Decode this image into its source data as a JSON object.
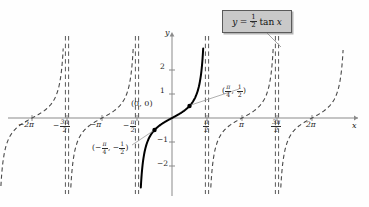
{
  "chart_data": {
    "type": "line",
    "equation_label": "y = ½ tan x",
    "xlabel": "x",
    "ylabel": "y",
    "xlim": [
      -7.2,
      7.4
    ],
    "ylim": [
      -2.9,
      2.9
    ],
    "grid": false,
    "legend": "none",
    "function": "y = 0.5 * tan(x)",
    "amplitude_factor": 0.5,
    "period": 3.14159,
    "x_ticks": [
      {
        "value": -6.2832,
        "label": "-2π",
        "num": "",
        "den": ""
      },
      {
        "value": -4.7124,
        "label": "-3π/2",
        "num": "3π",
        "den": "2"
      },
      {
        "value": -3.1416,
        "label": "-π",
        "num": "",
        "den": ""
      },
      {
        "value": -1.5708,
        "label": "-π/2",
        "num": "π",
        "den": "2"
      },
      {
        "value": 1.5708,
        "label": "π/2",
        "num": "π",
        "den": "2"
      },
      {
        "value": 3.1416,
        "label": "π",
        "num": "",
        "den": ""
      },
      {
        "value": 4.7124,
        "label": "3π/2",
        "num": "3π",
        "den": "2"
      },
      {
        "value": 6.2832,
        "label": "2π",
        "num": "",
        "den": ""
      }
    ],
    "y_ticks": [
      {
        "value": 2,
        "label": "2"
      },
      {
        "value": 1,
        "label": "1"
      },
      {
        "value": -1,
        "label": "-1"
      },
      {
        "value": -2,
        "label": "-2"
      }
    ],
    "asymptotes": [
      -4.7124,
      -1.5708,
      1.5708,
      4.7124
    ],
    "asymptote_style": "dashed-double",
    "solid_branch": {
      "from": -1.5708,
      "to": 1.5708,
      "style": "solid",
      "width": 2
    },
    "dashed_branches": [
      {
        "from": -7.85,
        "to": -4.7124
      },
      {
        "from": -4.7124,
        "to": -1.5708
      },
      {
        "from": 1.5708,
        "to": 4.7124
      },
      {
        "from": 4.7124,
        "to": 7.85
      }
    ],
    "points": [
      {
        "x": 0,
        "y": 0,
        "label": "(0, 0)",
        "marker": false
      },
      {
        "x": 0.7854,
        "y": 0.5,
        "label": "(π/4, 1/2)",
        "marker": true
      },
      {
        "x": -0.7854,
        "y": -0.5,
        "label": "(-π/4, -1/2)",
        "marker": true
      }
    ],
    "annotations": {
      "origin": "(0, 0)",
      "point_pos_open": "(",
      "point_pos_num1": "π",
      "point_pos_den1": "4",
      "point_pos_comma": ",",
      "point_pos_num2": "1",
      "point_pos_den2": "2",
      "point_pos_close": ")",
      "point_neg_open": "(−",
      "point_neg_num1": "π",
      "point_neg_den1": "4",
      "point_neg_comma": ", −",
      "point_neg_num2": "1",
      "point_neg_den2": "2",
      "point_neg_close": ")"
    },
    "equation": {
      "lhs": "y",
      "equals": "=",
      "coef_num": "1",
      "coef_den": "2",
      "rhs": "tan",
      "var": "x"
    },
    "colors": {
      "curve": "#000000",
      "dashed_curve": "#4a4a4a",
      "asymptote": "#5a5a5a",
      "axis": "#8a8a8a",
      "text": "#1a1a1a",
      "box_fill": "#c9c9c9",
      "box_border": "#5a5a5a",
      "leader": "#9a9a9a"
    }
  }
}
